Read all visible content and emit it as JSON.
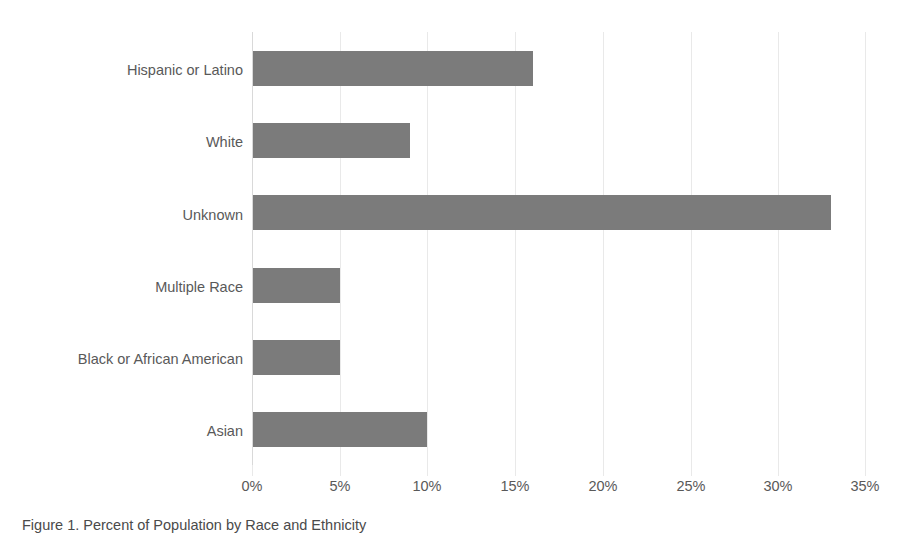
{
  "chart_data": {
    "type": "bar",
    "orientation": "horizontal",
    "title": "",
    "xlabel": "",
    "ylabel": "",
    "categories": [
      "Hispanic or Latino",
      "White",
      "Unknown",
      "Multiple Race",
      "Black or African American",
      "Asian"
    ],
    "values": [
      16,
      9,
      33,
      5,
      5,
      10
    ],
    "value_unit": "%",
    "xlim": [
      0,
      35
    ],
    "xticks": [
      0,
      5,
      10,
      15,
      20,
      25,
      30,
      35
    ],
    "xtick_labels": [
      "0%",
      "5%",
      "10%",
      "15%",
      "20%",
      "25%",
      "30%",
      "35%"
    ],
    "grid": "vertical",
    "legend": "none",
    "series": [
      {
        "name": "Percent",
        "values": [
          16,
          9,
          33,
          5,
          5,
          10
        ],
        "color": "#7b7b7b"
      }
    ]
  },
  "colors": {
    "bar_fill": "#7b7b7b",
    "gridline": "#e9e9e9",
    "axis_line": "#d9d9d9",
    "text": "#595959",
    "background": "#ffffff"
  },
  "caption": {
    "text": "Figure 1. Percent of Population by Race and Ethnicity",
    "note": "clipped-at-image-bottom-edge"
  }
}
